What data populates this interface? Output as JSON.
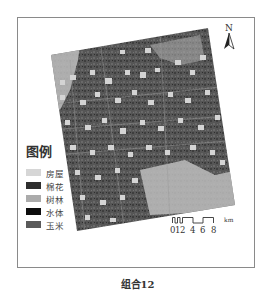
{
  "figure": {
    "caption": "组合12"
  },
  "legend": {
    "title": "图例",
    "items": [
      {
        "label": "房屋",
        "color": "#d6d6d6"
      },
      {
        "label": "棉花",
        "color": "#2e2e2e"
      },
      {
        "label": "树林",
        "color": "#ababab"
      },
      {
        "label": "水体",
        "color": "#0d0d0d"
      },
      {
        "label": "玉米",
        "color": "#5a5a5a"
      }
    ]
  },
  "north_arrow": {
    "letter": "N"
  },
  "scale_bar": {
    "unit": "km",
    "ticks": [
      "0",
      "1",
      "2",
      "4",
      "6",
      "8"
    ]
  },
  "map": {
    "base_color": "#555555",
    "patch_color": "#d2d2d2",
    "light_area_color": "#bdbdbd"
  }
}
